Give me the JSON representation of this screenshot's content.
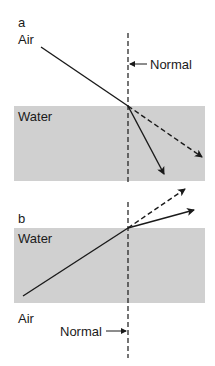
{
  "diagram": {
    "type": "refraction-diagram",
    "colors": {
      "water": "#d0d0d0",
      "line": "#1a1a1a",
      "background": "#ffffff"
    },
    "panel_a": {
      "letter": "a",
      "top_medium": "Air",
      "bottom_medium": "Water",
      "normal_label": "Normal",
      "rays": [
        {
          "kind": "incident",
          "style": "solid"
        },
        {
          "kind": "refracted",
          "style": "solid",
          "direction": "bends toward normal"
        },
        {
          "kind": "unrefracted-continuation",
          "style": "dashed"
        }
      ]
    },
    "panel_b": {
      "letter": "b",
      "top_medium": "Water",
      "bottom_medium": "Air",
      "normal_label": "Normal",
      "rays": [
        {
          "kind": "incident",
          "style": "solid"
        },
        {
          "kind": "refracted",
          "style": "solid",
          "direction": "bends away from normal"
        },
        {
          "kind": "unrefracted-continuation",
          "style": "dashed"
        }
      ]
    }
  }
}
